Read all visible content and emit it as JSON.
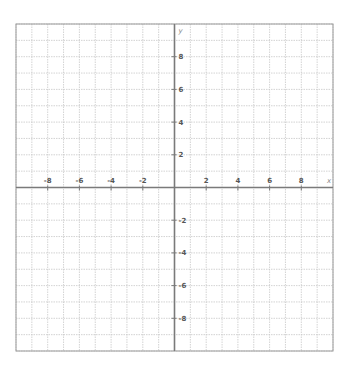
{
  "chart_data": {
    "type": "scatter",
    "title": "",
    "xlabel": "x",
    "ylabel": "y",
    "xlim": [
      -10,
      10
    ],
    "ylim": [
      -10,
      10
    ],
    "grid": true,
    "grid_step": 1,
    "x_ticks": [
      -8,
      -6,
      -4,
      -2,
      2,
      4,
      6,
      8
    ],
    "y_ticks": [
      -8,
      -6,
      -4,
      -2,
      2,
      4,
      6,
      8
    ],
    "series": [],
    "legend": null
  },
  "colors": {
    "grid": "#c8c8c8",
    "border": "#9a9a9a",
    "axis": "#7a7a7a",
    "label": "#555555"
  },
  "layout": {
    "plot_left": 16,
    "plot_top": 24,
    "plot_right": 333,
    "plot_bottom": 351
  }
}
